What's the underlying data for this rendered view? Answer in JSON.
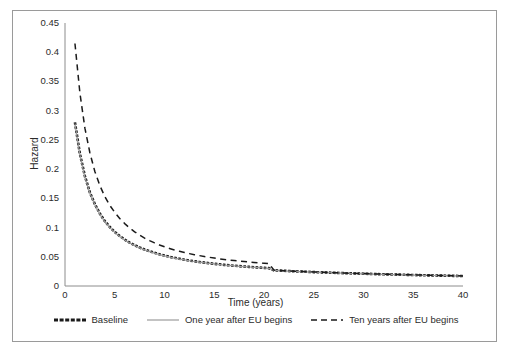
{
  "chart_data": {
    "type": "line",
    "title": "",
    "xlabel": "Time (years)",
    "ylabel": "Hazard",
    "xlim": [
      0,
      40
    ],
    "ylim": [
      0,
      0.45
    ],
    "grid": false,
    "legend_position": "bottom",
    "xticks": [
      "0",
      "5",
      "10",
      "15",
      "20",
      "25",
      "30",
      "35",
      "40"
    ],
    "xtick_values": [
      0,
      5,
      10,
      15,
      20,
      25,
      30,
      35,
      40
    ],
    "yticks": [
      "0",
      "0.05",
      "0.1",
      "0.15",
      "0.2",
      "0.25",
      "0.3",
      "0.35",
      "0.4",
      "0.45"
    ],
    "ytick_values": [
      0,
      0.05,
      0.1,
      0.15,
      0.2,
      0.25,
      0.3,
      0.35,
      0.4,
      0.45
    ],
    "x": [
      1,
      1.5,
      2,
      2.5,
      3,
      3.5,
      4,
      4.5,
      5,
      5.5,
      6,
      6.5,
      7,
      7.5,
      8,
      8.5,
      9,
      9.5,
      10,
      10.5,
      11,
      11.5,
      12,
      12.5,
      13,
      13.5,
      14,
      14.5,
      15,
      15.5,
      16,
      16.5,
      17,
      17.5,
      18,
      18.5,
      19,
      19.5,
      20,
      20.5,
      21,
      21.5,
      22,
      23,
      24,
      25,
      26,
      27,
      28,
      29,
      30,
      31,
      32,
      33,
      34,
      35,
      36,
      37,
      38,
      39,
      40
    ],
    "series": [
      {
        "name": "Baseline",
        "style": "thick-dotted",
        "color": "#1a1a1a",
        "values": [
          0.28,
          0.226,
          0.188,
          0.16,
          0.14,
          0.124,
          0.111,
          0.101,
          0.0925,
          0.0855,
          0.0795,
          0.0743,
          0.0698,
          0.0659,
          0.0624,
          0.0594,
          0.0567,
          0.0542,
          0.052,
          0.05,
          0.0482,
          0.0465,
          0.045,
          0.0436,
          0.0423,
          0.0411,
          0.04,
          0.039,
          0.038,
          0.0371,
          0.0362,
          0.0354,
          0.0347,
          0.034,
          0.0333,
          0.0327,
          0.0321,
          0.0315,
          0.031,
          0.0305,
          0.0268,
          0.0264,
          0.026,
          0.0252,
          0.0245,
          0.0238,
          0.0232,
          0.0226,
          0.022,
          0.0215,
          0.021,
          0.0205,
          0.02,
          0.0196,
          0.0192,
          0.0188,
          0.0184,
          0.018,
          0.0177,
          0.0174,
          0.0171
        ]
      },
      {
        "name": "One year after EU begins",
        "style": "thin-solid",
        "color": "#9b9b9b",
        "values": [
          0.278,
          0.224,
          0.186,
          0.159,
          0.139,
          0.123,
          0.11,
          0.1,
          0.0918,
          0.0848,
          0.0789,
          0.0737,
          0.0692,
          0.0653,
          0.0619,
          0.0589,
          0.0562,
          0.0538,
          0.0516,
          0.0496,
          0.0478,
          0.0461,
          0.0446,
          0.0432,
          0.0419,
          0.0408,
          0.0397,
          0.0387,
          0.0377,
          0.0368,
          0.0359,
          0.0352,
          0.0344,
          0.0337,
          0.0331,
          0.0325,
          0.0319,
          0.0313,
          0.0308,
          0.0303,
          0.0266,
          0.0262,
          0.0258,
          0.025,
          0.0243,
          0.0237,
          0.0231,
          0.0225,
          0.0219,
          0.0214,
          0.0209,
          0.0204,
          0.0199,
          0.0195,
          0.0191,
          0.0187,
          0.0183,
          0.018,
          0.0176,
          0.0173,
          0.017
        ]
      },
      {
        "name": "Ten years after EU begins",
        "style": "dashed",
        "color": "#1a1a1a",
        "values": [
          0.415,
          0.33,
          0.27,
          0.228,
          0.196,
          0.172,
          0.153,
          0.138,
          0.126,
          0.1155,
          0.1068,
          0.0992,
          0.0927,
          0.087,
          0.082,
          0.0776,
          0.0737,
          0.0702,
          0.0671,
          0.0643,
          0.0617,
          0.0594,
          0.0573,
          0.0554,
          0.0536,
          0.052,
          0.0505,
          0.0491,
          0.0478,
          0.0466,
          0.0455,
          0.0445,
          0.0435,
          0.0426,
          0.0418,
          0.041,
          0.0402,
          0.0395,
          0.0389,
          0.0383,
          0.0272,
          0.0267,
          0.0262,
          0.0254,
          0.0247,
          0.024,
          0.0234,
          0.0228,
          0.0222,
          0.0217,
          0.0212,
          0.0207,
          0.0202,
          0.0198,
          0.0194,
          0.019,
          0.0186,
          0.0182,
          0.0179,
          0.0176,
          0.0173
        ]
      }
    ]
  },
  "legend": {
    "entries": [
      {
        "label": "Baseline"
      },
      {
        "label": "One year after EU begins"
      },
      {
        "label": "Ten years after EU begins"
      }
    ]
  },
  "colors": {
    "axis": "#8c8c8c",
    "text": "#2b2b2b",
    "border": "#9a9a9a",
    "baseline": "#1a1a1a",
    "one_year": "#9b9b9b",
    "ten_years": "#1a1a1a",
    "background": "#ffffff"
  }
}
